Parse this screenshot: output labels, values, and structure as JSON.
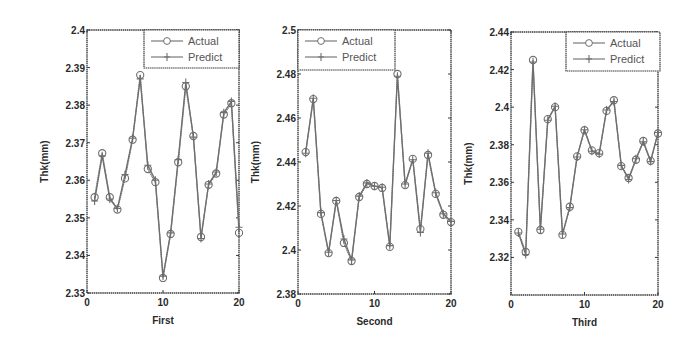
{
  "figure": {
    "width": 692,
    "height": 344,
    "line_color": "#6e6e6e",
    "frame_color": "#3a3a3a",
    "background": "#ffffff"
  },
  "chart_data": [
    {
      "type": "line",
      "title": "",
      "xlabel": "First",
      "ylabel": "Thk(mm)",
      "xlim": [
        0,
        20
      ],
      "ylim": [
        2.33,
        2.4
      ],
      "xticks": [
        0,
        10,
        20
      ],
      "xtick_labels": [
        "0",
        "10",
        "20"
      ],
      "yticks": [
        2.33,
        2.34,
        2.35,
        2.36,
        2.37,
        2.38,
        2.39,
        2.4
      ],
      "ytick_labels": [
        "2.33",
        "2.34",
        "2.35",
        "2.36",
        "2.37",
        "2.38",
        "2.39",
        "2.4"
      ],
      "grid": false,
      "legend_position": "upper right",
      "x": [
        1,
        2,
        3,
        4,
        5,
        6,
        7,
        8,
        9,
        10,
        11,
        12,
        13,
        14,
        15,
        16,
        17,
        18,
        19,
        20
      ],
      "series": [
        {
          "name": "Actual",
          "marker": "circle",
          "values": [
            2.3555,
            2.3672,
            2.3555,
            2.3522,
            2.3605,
            2.3708,
            2.388,
            2.363,
            2.3595,
            2.334,
            2.3457,
            2.3648,
            2.385,
            2.3718,
            2.3449,
            2.3588,
            2.3618,
            2.3775,
            2.3805,
            2.346
          ]
        },
        {
          "name": "Predict",
          "marker": "plus",
          "values": [
            2.3545,
            2.3665,
            2.355,
            2.3525,
            2.3615,
            2.3712,
            2.387,
            2.364,
            2.36,
            2.3345,
            2.346,
            2.3655,
            2.386,
            2.3715,
            2.3445,
            2.359,
            2.3622,
            2.378,
            2.381,
            2.3475
          ]
        }
      ],
      "box": {
        "x0": 87,
        "x1": 239,
        "y0": 30,
        "y1": 293
      },
      "legend_box": {
        "x0": 144,
        "x1": 239,
        "y0": 30,
        "y1": 68
      }
    },
    {
      "type": "line",
      "title": "",
      "xlabel": "Second",
      "ylabel": "Thk(mm)",
      "xlim": [
        0,
        20
      ],
      "ylim": [
        2.38,
        2.5
      ],
      "xticks": [
        0,
        10,
        20
      ],
      "xtick_labels": [
        "0",
        "10",
        "20"
      ],
      "yticks": [
        2.38,
        2.4,
        2.42,
        2.44,
        2.46,
        2.48,
        2.5
      ],
      "ytick_labels": [
        "2.38",
        "2.4",
        "2.42",
        "2.44",
        "2.46",
        "2.48",
        "2.5"
      ],
      "grid": false,
      "legend_position": "upper left",
      "x": [
        1,
        2,
        3,
        4,
        5,
        6,
        7,
        8,
        9,
        10,
        11,
        12,
        13,
        14,
        15,
        16,
        17,
        18,
        19,
        20
      ],
      "series": [
        {
          "name": "Actual",
          "marker": "circle",
          "values": [
            2.4445,
            2.4686,
            2.4164,
            2.3986,
            2.4223,
            2.4032,
            2.395,
            2.4241,
            2.43,
            2.4291,
            2.4282,
            2.4014,
            2.48,
            2.4295,
            2.4414,
            2.4095,
            2.4432,
            2.4255,
            2.416,
            2.4127
          ]
        },
        {
          "name": "Predict",
          "marker": "plus",
          "values": [
            2.444,
            2.469,
            2.417,
            2.399,
            2.4225,
            2.405,
            2.3955,
            2.4245,
            2.4305,
            2.429,
            2.4285,
            2.402,
            2.479,
            2.43,
            2.441,
            2.408,
            2.444,
            2.426,
            2.4165,
            2.413
          ]
        }
      ],
      "box": {
        "x0": 298,
        "x1": 451,
        "y0": 30,
        "y1": 294
      },
      "legend_box": {
        "x0": 298,
        "x1": 395,
        "y0": 30,
        "y1": 70
      }
    },
    {
      "type": "line",
      "title": "",
      "xlabel": "Third",
      "ylabel": "Thk(mm)",
      "xlim": [
        0,
        20
      ],
      "ylim": [
        2.3,
        2.44
      ],
      "xticks": [
        0,
        10,
        20
      ],
      "xtick_labels": [
        "0",
        "10",
        "20"
      ],
      "yticks": [
        2.32,
        2.34,
        2.36,
        2.38,
        2.4,
        2.42,
        2.44
      ],
      "ytick_labels": [
        "2.32",
        "2.34",
        "2.36",
        "2.38",
        "2.4",
        "2.42",
        "2.44"
      ],
      "grid": false,
      "legend_position": "upper right",
      "x": [
        1,
        2,
        3,
        4,
        5,
        6,
        7,
        8,
        9,
        10,
        11,
        12,
        13,
        14,
        15,
        16,
        17,
        18,
        19,
        20
      ],
      "series": [
        {
          "name": "Actual",
          "marker": "circle",
          "values": [
            2.3336,
            2.3229,
            2.4251,
            2.3346,
            2.3936,
            2.4,
            2.332,
            2.347,
            2.3738,
            2.3877,
            2.377,
            2.3755,
            2.398,
            2.4037,
            2.3686,
            2.3623,
            2.372,
            2.382,
            2.3714,
            2.386
          ]
        },
        {
          "name": "Predict",
          "marker": "plus",
          "values": [
            2.333,
            2.3215,
            2.424,
            2.335,
            2.393,
            2.4005,
            2.3325,
            2.3465,
            2.3735,
            2.388,
            2.3765,
            2.375,
            2.3985,
            2.403,
            2.369,
            2.3615,
            2.3725,
            2.3815,
            2.371,
            2.3865
          ]
        }
      ],
      "box": {
        "x0": 511,
        "x1": 658,
        "y0": 32,
        "y1": 295
      },
      "legend_box": {
        "x0": 566,
        "x1": 660,
        "y0": 32,
        "y1": 71
      }
    }
  ]
}
